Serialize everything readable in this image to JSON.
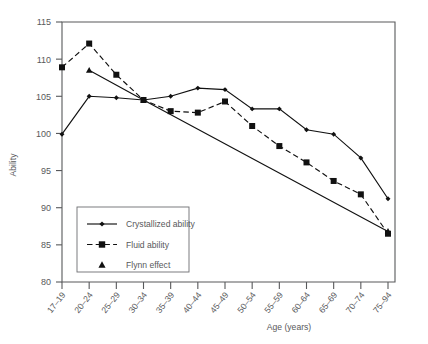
{
  "chart_data": {
    "type": "line",
    "title": "",
    "xlabel": "Age (years)",
    "ylabel": "Ability",
    "ylim": [
      80,
      115
    ],
    "yticks": [
      80,
      85,
      90,
      95,
      100,
      105,
      110,
      115
    ],
    "grid": false,
    "legend_position": "lower-left-inside",
    "categories": [
      "17–19",
      "20–24",
      "25–29",
      "30–34",
      "35–39",
      "40–44",
      "45–49",
      "50–54",
      "55–59",
      "60–64",
      "65–69",
      "70–74",
      "75–94"
    ],
    "series": [
      {
        "name": "Crystallized ability",
        "marker": "diamond",
        "linestyle": "solid",
        "color": "#111111",
        "values": [
          99.9,
          105.0,
          104.8,
          104.5,
          105.0,
          106.1,
          105.9,
          103.3,
          103.3,
          100.5,
          99.9,
          96.7,
          91.2
        ]
      },
      {
        "name": "Fluid ability",
        "marker": "square",
        "linestyle": "dashed",
        "color": "#111111",
        "values": [
          108.9,
          112.1,
          107.9,
          104.5,
          103.0,
          102.8,
          104.3,
          101.0,
          98.3,
          96.1,
          93.6,
          91.8,
          86.5
        ]
      },
      {
        "name": "Flynn effect",
        "marker": "triangle",
        "linestyle": "solid",
        "color": "#111111",
        "values": [
          null,
          108.5,
          null,
          104.5,
          null,
          null,
          null,
          null,
          null,
          null,
          null,
          null,
          86.8
        ]
      }
    ]
  },
  "legend": {
    "items": [
      {
        "label": "Crystallized ability",
        "marker": "diamond",
        "linestyle": "solid"
      },
      {
        "label": "Fluid ability",
        "marker": "square",
        "linestyle": "dashed"
      },
      {
        "label": "Flynn effect",
        "marker": "triangle",
        "linestyle": "none"
      }
    ]
  },
  "axes": {
    "y_title": "Ability",
    "x_title": "Age (years)",
    "y_tick_labels": [
      "115",
      "110",
      "105",
      "100",
      "95",
      "90",
      "85",
      "80"
    ],
    "x_tick_labels": [
      "17–19",
      "20–24",
      "25–29",
      "30–34",
      "35–39",
      "40–44",
      "45–49",
      "50–54",
      "55–59",
      "60–64",
      "65–69",
      "70–74",
      "75–94"
    ]
  }
}
